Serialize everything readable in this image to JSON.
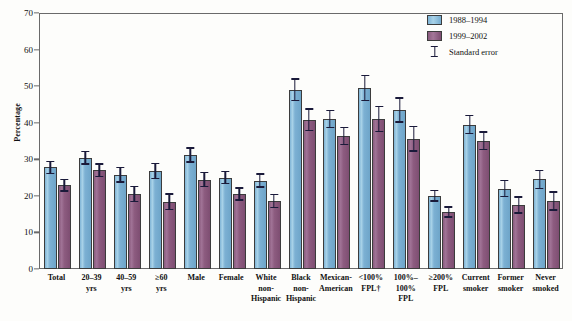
{
  "chart_data": {
    "type": "bar",
    "title": "",
    "xlabel": "",
    "ylabel": "Percentage",
    "ylim": [
      0,
      70
    ],
    "yticks": [
      0,
      10,
      20,
      30,
      40,
      50,
      60,
      70
    ],
    "grid": false,
    "legend_position": "top-right",
    "categories": [
      "Total",
      "20–39 yrs",
      "40–59 yrs",
      "≥60 yrs",
      "Male",
      "Female",
      "White non-Hispanic",
      "Black non-Hispanic",
      "Mexican-American",
      "<100% FPL†",
      "100%–100% FPL",
      "≥200% FPL",
      "Current smoker",
      "Former smoker",
      "Never smoked"
    ],
    "category_lines": [
      [
        "Total"
      ],
      [
        "20–39",
        "yrs"
      ],
      [
        "40–59",
        "yrs"
      ],
      [
        "≥60",
        "yrs"
      ],
      [
        "Male"
      ],
      [
        "Female"
      ],
      [
        "White",
        "non-",
        "Hispanic"
      ],
      [
        "Black",
        "non-",
        "Hispanic"
      ],
      [
        "Mexican-",
        "American"
      ],
      [
        "<100%",
        "FPL†"
      ],
      [
        "100%–",
        "100%",
        "FPL"
      ],
      [
        "≥200%",
        "FPL"
      ],
      [
        "Current",
        "smoker"
      ],
      [
        "Former",
        "smoker"
      ],
      [
        "Never",
        "smoked"
      ]
    ],
    "series": [
      {
        "name": "1988–1994",
        "color": "#7fb4d6",
        "values": [
          27.8,
          30.4,
          25.8,
          26.8,
          31.2,
          25.0,
          24.2,
          49.0,
          41.0,
          49.5,
          43.5,
          20.0,
          39.5,
          22.0,
          24.5
        ],
        "errors": [
          1.8,
          1.9,
          2.2,
          2.3,
          2.1,
          1.8,
          2.0,
          3.1,
          2.5,
          3.6,
          3.5,
          1.6,
          2.6,
          2.4,
          2.6
        ]
      },
      {
        "name": "1999–2002",
        "color": "#8a5b7e",
        "values": [
          22.9,
          27.0,
          20.5,
          18.4,
          24.4,
          20.5,
          18.6,
          40.8,
          36.4,
          41.0,
          35.6,
          15.6,
          35.1,
          17.5,
          18.6
        ]
      }
    ]
  },
  "legend": {
    "items": [
      {
        "label": "1988–1994",
        "type": "swatch-blue"
      },
      {
        "label": "1999–2002",
        "type": "swatch-purple"
      },
      {
        "label": "Standard error",
        "type": "errorbar"
      }
    ]
  },
  "axis": {
    "y_title": "Percentage",
    "y_ticks": [
      "70",
      "60",
      "50",
      "40",
      "30",
      "20",
      "10",
      "0"
    ]
  },
  "colors": {
    "series_1988": "#7fb4d6",
    "series_1999": "#8a5b7e",
    "axis": "#6a6a6a",
    "error": "#1a1a3a",
    "background": "#fdfdfb"
  }
}
